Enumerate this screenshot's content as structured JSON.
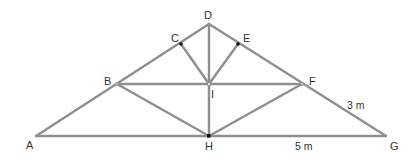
{
  "diagram": {
    "type": "roof truss",
    "colors": {
      "member": "#8f8f8f",
      "label": "#333333",
      "joint_dot": "#111111",
      "background": "#ffffff"
    },
    "points": {
      "A": {
        "label": "A",
        "x": 36,
        "y": 136
      },
      "B": {
        "label": "B",
        "x": 117,
        "y": 84
      },
      "C": {
        "label": "C",
        "x": 181,
        "y": 44
      },
      "D": {
        "label": "D",
        "x": 209,
        "y": 24
      },
      "E": {
        "label": "E",
        "x": 238,
        "y": 44
      },
      "F": {
        "label": "F",
        "x": 302,
        "y": 84
      },
      "G": {
        "label": "G",
        "x": 386,
        "y": 136
      },
      "H": {
        "label": "H",
        "x": 209,
        "y": 136
      },
      "I": {
        "label": "I",
        "x": 209,
        "y": 84
      }
    },
    "members": [
      [
        "A",
        "D"
      ],
      [
        "D",
        "G"
      ],
      [
        "A",
        "G"
      ],
      [
        "D",
        "H"
      ],
      [
        "B",
        "F"
      ],
      [
        "B",
        "H"
      ],
      [
        "F",
        "H"
      ],
      [
        "C",
        "I"
      ],
      [
        "E",
        "I"
      ]
    ],
    "dimensions": [
      {
        "text": "3 m",
        "along": "FG"
      },
      {
        "text": "5 m",
        "along": "HG"
      }
    ]
  }
}
